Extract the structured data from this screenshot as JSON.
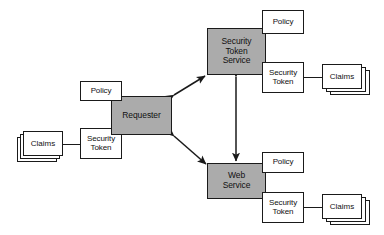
{
  "diagram": {
    "colors": {
      "shaded_fill": "#ababab",
      "box_fill": "#ffffff",
      "stroke": "#1a1a1a",
      "background": "#ffffff"
    },
    "nodes": {
      "requester": {
        "label": "Requester",
        "kind": "shaded"
      },
      "requester_policy": {
        "label": "Policy",
        "kind": "white"
      },
      "requester_security_token": {
        "label": "Security\nToken",
        "kind": "white"
      },
      "requester_claims": {
        "label": "Claims",
        "kind": "stack"
      },
      "security_token_service": {
        "label": "Security\nToken\nService",
        "kind": "shaded"
      },
      "sts_policy": {
        "label": "Policy",
        "kind": "white"
      },
      "sts_security_token": {
        "label": "Security\nToken",
        "kind": "white"
      },
      "sts_claims": {
        "label": "Claims",
        "kind": "stack"
      },
      "web_service": {
        "label": "Web\nService",
        "kind": "shaded"
      },
      "ws_policy": {
        "label": "Policy",
        "kind": "white"
      },
      "ws_security_token": {
        "label": "Security\nToken",
        "kind": "white"
      },
      "ws_claims": {
        "label": "Claims",
        "kind": "stack"
      }
    },
    "connections": [
      {
        "name": "requester-to-sts",
        "from": "requester",
        "to": "security_token_service",
        "style": "double-arrow"
      },
      {
        "name": "requester-to-web-service",
        "from": "requester",
        "to": "web_service",
        "style": "double-arrow"
      },
      {
        "name": "sts-to-web-service",
        "from": "security_token_service",
        "to": "web_service",
        "style": "double-arrow"
      },
      {
        "name": "requester-claims-link",
        "from": "requester_claims",
        "to": "requester_security_token",
        "style": "line"
      },
      {
        "name": "sts-claims-link",
        "from": "sts_security_token",
        "to": "sts_claims",
        "style": "line"
      },
      {
        "name": "ws-claims-link",
        "from": "ws_security_token",
        "to": "ws_claims",
        "style": "line"
      }
    ]
  }
}
